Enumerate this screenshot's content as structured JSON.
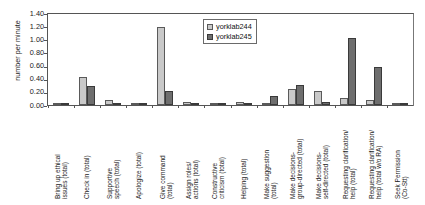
{
  "chart_data": {
    "type": "bar",
    "title": "",
    "xlabel": "",
    "ylabel": "number per minute",
    "ylim": [
      0,
      1.4
    ],
    "ytick_labels": [
      "1.40",
      "1.20",
      "1.00",
      "0.80",
      "0.60",
      "0.40",
      "0.20",
      "0.00"
    ],
    "ytick_values": [
      1.4,
      1.2,
      1.0,
      0.8,
      0.6,
      0.4,
      0.2,
      0.0
    ],
    "grid": false,
    "legend_position": "top-right",
    "categories": [
      "Bring up ethical\nissues (total)",
      "Check in (total)",
      "Supportive\nspeech (total)",
      "Apologize (total)",
      "Give command\n(total)",
      "Assign roles/\nactions (total)",
      "Constructive\ncriticism (total)",
      "Helping (total)",
      "Make suggestion\n(total)",
      "Make decisions-\ngroup-directed (total)",
      "Make decisions-\nself-directed (total)",
      "Requesting clarification/\nhelp (total)",
      "Requesting clarification/\nhelp (total w/o RA)",
      "Seek Permission\n(Co-Stt)"
    ],
    "series": [
      {
        "name": "yorklab244",
        "color": "#c9c9c9",
        "values": [
          0.0,
          0.43,
          0.07,
          0.02,
          1.18,
          0.05,
          0.02,
          0.05,
          0.02,
          0.25,
          0.22,
          0.1,
          0.08,
          0.01
        ]
      },
      {
        "name": "yorklab245",
        "color": "#6e6e6e",
        "values": [
          0.0,
          0.29,
          0.03,
          0.01,
          0.21,
          0.02,
          0.02,
          0.03,
          0.13,
          0.31,
          0.04,
          1.02,
          0.58,
          0.02
        ]
      }
    ]
  }
}
